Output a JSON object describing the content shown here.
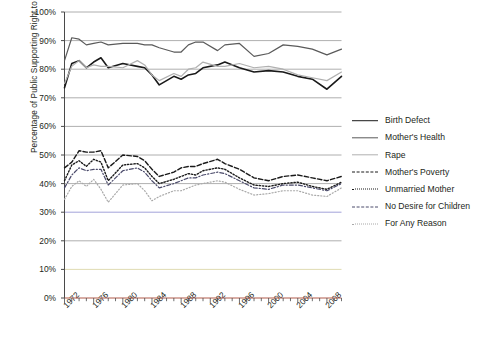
{
  "chart_data": {
    "type": "line",
    "title": "",
    "xlabel": "",
    "ylabel": "Percentage of Public Supporting Right to Abortion",
    "ylim": [
      0,
      100
    ],
    "xlim": [
      1972,
      2010
    ],
    "grid": true,
    "legend_position": "right",
    "y_ticks": [
      "0%",
      "10%",
      "20%",
      "30%",
      "40%",
      "50%",
      "60%",
      "70%",
      "80%",
      "90%",
      "100%"
    ],
    "y_tick_values": [
      0,
      10,
      20,
      30,
      40,
      50,
      60,
      70,
      80,
      90,
      100
    ],
    "x_ticks": [
      "1972",
      "1976",
      "1980",
      "1984",
      "1988",
      "1992",
      "1996",
      "2000",
      "2004",
      "2008"
    ],
    "x_tick_values": [
      1972,
      1976,
      1980,
      1984,
      1988,
      1992,
      1996,
      2000,
      2004,
      2008
    ],
    "x": [
      1972,
      1973,
      1974,
      1975,
      1976,
      1977,
      1978,
      1980,
      1982,
      1983,
      1984,
      1985,
      1987,
      1988,
      1989,
      1990,
      1991,
      1993,
      1994,
      1996,
      1998,
      2000,
      2002,
      2004,
      2006,
      2008,
      2010
    ],
    "series": [
      {
        "name": "Birth Defect",
        "color": "#1a1a1a",
        "style": "solid",
        "width": 1.6,
        "values": [
          73.5,
          82.0,
          83.0,
          80.5,
          82.5,
          84.0,
          80.5,
          82.0,
          81.0,
          80.5,
          78.0,
          74.5,
          77.5,
          76.5,
          78.0,
          78.5,
          80.5,
          81.5,
          82.5,
          80.5,
          79.0,
          79.5,
          79.0,
          77.5,
          76.5,
          73.0,
          77.5
        ]
      },
      {
        "name": "Mother's Health",
        "color": "#5a5a5a",
        "style": "solid",
        "width": 1.2,
        "values": [
          83.0,
          91.0,
          90.5,
          88.5,
          89.0,
          89.5,
          88.5,
          89.0,
          89.0,
          88.5,
          88.5,
          87.5,
          86.0,
          86.0,
          88.5,
          89.5,
          89.5,
          86.5,
          88.5,
          89.0,
          84.5,
          85.5,
          88.5,
          88.0,
          87.0,
          85.0,
          87.0
        ]
      },
      {
        "name": "Rape",
        "color": "#b0b0b0",
        "style": "solid",
        "width": 1.2,
        "values": [
          75.0,
          81.0,
          83.0,
          80.5,
          81.5,
          81.0,
          81.0,
          80.5,
          83.0,
          81.5,
          78.0,
          76.0,
          78.5,
          77.5,
          80.0,
          80.5,
          82.5,
          81.0,
          81.0,
          82.0,
          80.5,
          81.0,
          80.0,
          78.0,
          77.0,
          76.0,
          79.0
        ]
      },
      {
        "name": "Mother's Poverty",
        "color": "#1a1a1a",
        "style": "dashed",
        "width": 1.4,
        "values": [
          45.5,
          47.5,
          51.5,
          51.0,
          51.0,
          51.5,
          45.5,
          50.0,
          49.5,
          48.0,
          45.0,
          42.5,
          44.0,
          45.5,
          46.0,
          46.0,
          47.0,
          48.5,
          47.0,
          45.0,
          42.0,
          41.0,
          42.5,
          43.0,
          42.0,
          41.0,
          42.5
        ]
      },
      {
        "name": "Unmarried Mother",
        "color": "#1a1a1a",
        "style": "dotted",
        "width": 1.4,
        "values": [
          41.0,
          46.5,
          48.0,
          46.0,
          48.5,
          47.5,
          41.0,
          46.5,
          47.0,
          45.5,
          42.5,
          40.0,
          41.5,
          42.5,
          43.5,
          43.0,
          44.5,
          45.5,
          45.0,
          42.0,
          39.5,
          39.0,
          40.0,
          40.5,
          39.0,
          38.0,
          40.5
        ]
      },
      {
        "name": "No Desire for Children",
        "color": "#4a4a6a",
        "style": "dashdot",
        "width": 1.2,
        "values": [
          38.5,
          43.0,
          45.5,
          44.5,
          45.0,
          45.0,
          39.5,
          44.5,
          45.5,
          44.0,
          41.0,
          38.5,
          40.0,
          41.0,
          42.0,
          42.0,
          43.0,
          44.0,
          43.5,
          41.0,
          38.5,
          38.0,
          39.5,
          39.5,
          38.5,
          37.5,
          40.0
        ]
      },
      {
        "name": "For Any Reason",
        "color": "#a8a8a8",
        "style": "dotted-fine",
        "width": 1.2,
        "values": [
          34.5,
          39.0,
          41.0,
          39.0,
          41.5,
          38.0,
          33.5,
          39.5,
          40.0,
          37.5,
          34.0,
          35.5,
          37.5,
          37.5,
          38.5,
          39.5,
          40.0,
          41.0,
          40.5,
          38.0,
          36.0,
          36.5,
          37.5,
          37.5,
          36.0,
          35.5,
          38.5
        ]
      }
    ]
  },
  "axis": {
    "gridline_colors": {
      "default": "#9a9a9a",
      "30": "#8a8ad0",
      "10": "#d8d2a0"
    }
  }
}
